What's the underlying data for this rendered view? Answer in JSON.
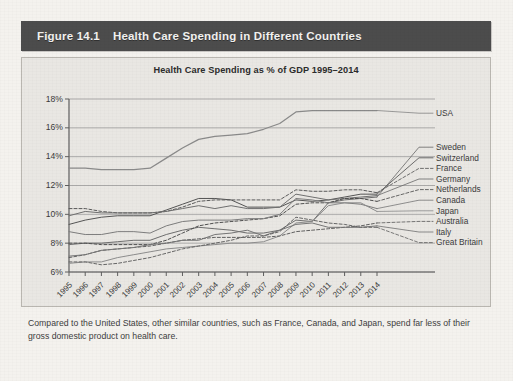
{
  "figure": {
    "number": "Figure 14.1",
    "title": "Health Care Spending in Different Countries"
  },
  "caption": "Compared to the United States, other similar countries, such as France, Canada, and Japan, spend far less of their gross domestic product on health care.",
  "chart_data": {
    "type": "line",
    "title": "Health Care Spending as % of GDP 1995–2014",
    "xlabel": "",
    "ylabel": "",
    "ylim": [
      6,
      18
    ],
    "yticks": [
      6,
      8,
      10,
      12,
      14,
      16,
      18
    ],
    "ytick_labels": [
      "6%",
      "8%",
      "10%",
      "12%",
      "14%",
      "16%",
      "18%"
    ],
    "grid": true,
    "legend_position": "right-of-plot-line-ends",
    "categories": [
      "1995",
      "1996",
      "1997",
      "1998",
      "1999",
      "2000",
      "2001",
      "2002",
      "2003",
      "2004",
      "2005",
      "2006",
      "2007",
      "2008",
      "2009",
      "2010",
      "2011",
      "2012",
      "2013",
      "2014"
    ],
    "series": [
      {
        "name": "USA",
        "style": "solid",
        "color": "#8a8a8a",
        "values": [
          13.2,
          13.2,
          13.1,
          13.1,
          13.1,
          13.2,
          13.9,
          14.6,
          15.2,
          15.4,
          15.5,
          15.6,
          15.9,
          16.3,
          17.1,
          17.2,
          17.2,
          17.2,
          17.2,
          17.2
        ]
      },
      {
        "name": "Sweden",
        "style": "solid",
        "color": "#6e6e6e",
        "values": [
          7.9,
          8.0,
          8.0,
          8.1,
          8.2,
          8.2,
          8.6,
          8.9,
          9.1,
          9.0,
          8.9,
          8.7,
          8.7,
          8.9,
          9.6,
          9.5,
          10.8,
          11.0,
          11.1,
          11.2
        ]
      },
      {
        "name": "Switzerland",
        "style": "solid",
        "color": "#555555",
        "values": [
          9.3,
          9.6,
          9.8,
          9.9,
          9.9,
          9.9,
          10.3,
          10.7,
          11.1,
          11.1,
          11.0,
          10.5,
          10.5,
          10.5,
          11.0,
          10.9,
          11.0,
          11.2,
          11.4,
          11.4
        ]
      },
      {
        "name": "France",
        "style": "dashed",
        "color": "#5a5a5a",
        "values": [
          10.4,
          10.4,
          10.2,
          10.1,
          10.1,
          10.1,
          10.2,
          10.5,
          10.9,
          11.0,
          11.0,
          11.0,
          11.0,
          11.0,
          11.7,
          11.6,
          11.6,
          11.7,
          11.7,
          11.5
        ]
      },
      {
        "name": "Germany",
        "style": "solid",
        "color": "#707070",
        "values": [
          9.9,
          10.2,
          10.1,
          10.1,
          10.1,
          10.1,
          10.2,
          10.4,
          10.6,
          10.4,
          10.6,
          10.4,
          10.4,
          10.5,
          11.4,
          11.2,
          11.0,
          11.1,
          11.2,
          11.3
        ]
      },
      {
        "name": "Netherlands",
        "style": "dashed",
        "color": "#4f4f4f",
        "values": [
          8.0,
          8.0,
          7.9,
          7.9,
          7.9,
          7.9,
          8.2,
          8.7,
          9.2,
          9.4,
          9.5,
          9.6,
          9.7,
          9.9,
          10.7,
          10.8,
          10.8,
          11.1,
          11.1,
          10.9
        ]
      },
      {
        "name": "Canada",
        "style": "solid",
        "color": "#7d7d7d",
        "values": [
          8.8,
          8.6,
          8.6,
          8.8,
          8.8,
          8.7,
          9.2,
          9.5,
          9.6,
          9.6,
          9.6,
          9.7,
          9.7,
          10.0,
          11.1,
          11.0,
          10.8,
          10.8,
          10.7,
          10.4
        ]
      },
      {
        "name": "Japan",
        "style": "solid",
        "color": "#8d8d8d",
        "values": [
          6.6,
          6.7,
          6.7,
          7.0,
          7.2,
          7.4,
          7.6,
          7.7,
          7.8,
          7.9,
          8.0,
          8.0,
          8.1,
          8.5,
          9.4,
          9.5,
          10.6,
          10.8,
          10.8,
          10.2
        ]
      },
      {
        "name": "Australia",
        "style": "dashed",
        "color": "#606060",
        "values": [
          7.0,
          7.2,
          7.5,
          7.6,
          7.7,
          7.8,
          8.0,
          8.2,
          8.3,
          8.4,
          8.4,
          8.4,
          8.4,
          8.5,
          8.8,
          8.9,
          9.0,
          9.1,
          9.2,
          9.4
        ]
      },
      {
        "name": "Italy",
        "style": "solid",
        "color": "#767676",
        "values": [
          7.1,
          7.2,
          7.5,
          7.6,
          7.7,
          7.9,
          8.0,
          8.2,
          8.2,
          8.6,
          8.7,
          8.9,
          8.5,
          8.9,
          9.3,
          9.4,
          9.1,
          9.1,
          9.1,
          9.2
        ]
      },
      {
        "name": "Great Britain",
        "style": "dashed",
        "color": "#666666",
        "values": [
          6.7,
          6.7,
          6.5,
          6.6,
          6.8,
          7.0,
          7.3,
          7.6,
          7.8,
          8.0,
          8.2,
          8.5,
          8.5,
          8.8,
          9.8,
          9.6,
          9.4,
          9.3,
          9.1,
          9.1
        ]
      }
    ],
    "label_order_top_to_bottom": [
      "USA",
      "Sweden",
      "Switzerland",
      "France",
      "Germany",
      "Netherlands",
      "Canada",
      "Japan",
      "Australia",
      "Italy",
      "Great Britain"
    ]
  }
}
